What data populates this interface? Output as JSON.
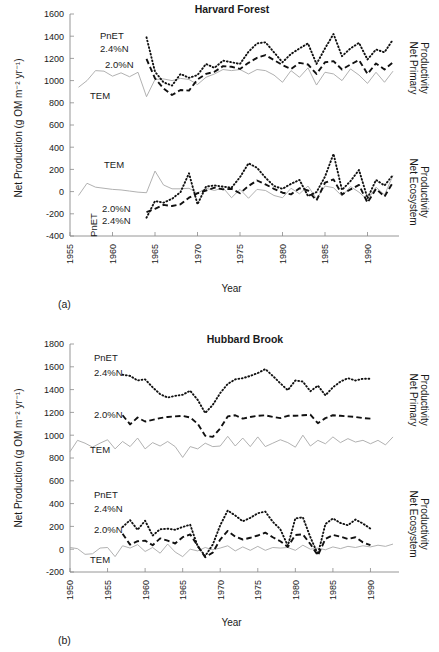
{
  "figure": {
    "y_axis_label": "Net Production (g OM m⁻² yr⁻¹)",
    "x_axis_label": "Year",
    "right_label_npp": "Net Primary Productivity",
    "right_label_nep": "Net Ecosystem Productivity",
    "panel_a_letter": "(a)",
    "panel_b_letter": "(b)",
    "series_label_pnet": "PnET",
    "series_label_n24": "2.4%N",
    "series_label_n20": "2.0%N",
    "series_label_tem": "TEM",
    "colors": {
      "tem": "#a8a8a8",
      "pnet": "#111111",
      "axis": "#8a8a8a",
      "text": "#1a1a1a",
      "background": "#ffffff"
    }
  },
  "chart_data": [
    {
      "type": "line",
      "title": "Harvard Forest",
      "panel": "(a)",
      "xlabel": "Year",
      "ylabel": "Net Production (g OM m⁻² yr⁻¹)",
      "right_labels": [
        "Net Primary Productivity",
        "Net Ecosystem Productivity"
      ],
      "xlim": [
        1955,
        1993
      ],
      "ylim": [
        -400,
        1600
      ],
      "yticks": [
        -400,
        -200,
        0,
        200,
        400,
        600,
        800,
        1000,
        1200,
        1400,
        1600
      ],
      "xticks": [
        1955,
        1960,
        1965,
        1970,
        1975,
        1980,
        1985,
        1990
      ],
      "grid": false,
      "legend": "in-plot annotations",
      "series": [
        {
          "name": "TEM",
          "group": "Net Primary Productivity",
          "style": "solid-gray",
          "x": [
            1956,
            1957,
            1958,
            1959,
            1960,
            1961,
            1962,
            1963,
            1964,
            1965,
            1966,
            1967,
            1968,
            1969,
            1970,
            1971,
            1972,
            1973,
            1974,
            1975,
            1976,
            1977,
            1978,
            1979,
            1980,
            1981,
            1982,
            1983,
            1984,
            1985,
            1986,
            1987,
            1988,
            1989,
            1990,
            1991,
            1992,
            1993
          ],
          "values": [
            940,
            1000,
            1090,
            1085,
            1040,
            1070,
            1035,
            1075,
            855,
            1010,
            1015,
            1000,
            1020,
            1010,
            965,
            1030,
            1060,
            1100,
            1090,
            1100,
            1060,
            1100,
            1090,
            1050,
            985,
            1090,
            1030,
            1115,
            960,
            1075,
            1060,
            1000,
            1105,
            1050,
            975,
            1075,
            985,
            1085
          ]
        },
        {
          "name": "PnET 2.0%N",
          "group": "Net Primary Productivity",
          "style": "dashed",
          "x": [
            1964,
            1965,
            1966,
            1967,
            1968,
            1969,
            1970,
            1971,
            1972,
            1973,
            1974,
            1975,
            1976,
            1977,
            1978,
            1979,
            1980,
            1981,
            1982,
            1983,
            1984,
            1985,
            1986,
            1987,
            1988,
            1989,
            1990,
            1991,
            1992,
            1993
          ],
          "values": [
            1195,
            1020,
            930,
            870,
            915,
            910,
            1010,
            1060,
            1080,
            1130,
            1125,
            1105,
            1160,
            1205,
            1230,
            1185,
            1140,
            1105,
            1160,
            1145,
            1060,
            1165,
            1175,
            1100,
            1145,
            1185,
            1060,
            1155,
            1100,
            1165
          ]
        },
        {
          "name": "PnET 2.4%N",
          "group": "Net Primary Productivity",
          "style": "dotted",
          "x": [
            1964,
            1965,
            1966,
            1967,
            1968,
            1969,
            1970,
            1971,
            1972,
            1973,
            1974,
            1975,
            1976,
            1977,
            1978,
            1979,
            1980,
            1981,
            1982,
            1983,
            1984,
            1985,
            1986,
            1987,
            1988,
            1989,
            1990,
            1991,
            1992,
            1993
          ],
          "values": [
            1390,
            1080,
            985,
            955,
            1060,
            1025,
            1050,
            1150,
            1115,
            1180,
            1165,
            1150,
            1260,
            1335,
            1345,
            1255,
            1165,
            1240,
            1290,
            1335,
            1150,
            1290,
            1420,
            1220,
            1290,
            1340,
            1190,
            1280,
            1255,
            1370
          ]
        },
        {
          "name": "TEM",
          "group": "Net Ecosystem Productivity",
          "style": "solid-gray",
          "x": [
            1956,
            1957,
            1958,
            1959,
            1960,
            1961,
            1962,
            1963,
            1964,
            1965,
            1966,
            1967,
            1968,
            1969,
            1970,
            1971,
            1972,
            1973,
            1974,
            1975,
            1976,
            1977,
            1978,
            1979,
            1980,
            1981,
            1982,
            1983,
            1984,
            1985,
            1986,
            1987,
            1988,
            1989,
            1990,
            1991,
            1992,
            1993
          ],
          "values": [
            -35,
            75,
            40,
            30,
            20,
            15,
            5,
            -5,
            -10,
            185,
            60,
            25,
            25,
            30,
            -15,
            30,
            10,
            35,
            -55,
            20,
            -60,
            20,
            10,
            -35,
            -55,
            30,
            -20,
            50,
            -65,
            50,
            35,
            -40,
            45,
            -5,
            -75,
            40,
            -30,
            145
          ]
        },
        {
          "name": "PnET 2.0%N",
          "group": "Net Ecosystem Productivity",
          "style": "dashed",
          "x": [
            1964,
            1965,
            1966,
            1967,
            1968,
            1969,
            1970,
            1971,
            1972,
            1973,
            1974,
            1975,
            1976,
            1977,
            1978,
            1979,
            1980,
            1981,
            1982,
            1983,
            1984,
            1985,
            1986,
            1987,
            1988,
            1989,
            1990,
            1991,
            1992,
            1993
          ],
          "values": [
            -185,
            -155,
            -120,
            -130,
            -115,
            -55,
            -15,
            10,
            35,
            20,
            25,
            -15,
            50,
            100,
            65,
            25,
            -10,
            -25,
            30,
            10,
            -80,
            80,
            110,
            -25,
            20,
            60,
            -100,
            25,
            -45,
            85
          ]
        },
        {
          "name": "PnET 2.4%N",
          "group": "Net Ecosystem Productivity",
          "style": "dotted",
          "x": [
            1964,
            1965,
            1966,
            1967,
            1968,
            1969,
            1970,
            1971,
            1972,
            1973,
            1974,
            1975,
            1976,
            1977,
            1978,
            1979,
            1980,
            1981,
            1982,
            1983,
            1984,
            1985,
            1986,
            1987,
            1988,
            1989,
            1990,
            1991,
            1992,
            1993
          ],
          "values": [
            -235,
            -85,
            -100,
            -65,
            -5,
            165,
            -115,
            45,
            55,
            45,
            35,
            130,
            255,
            215,
            125,
            50,
            25,
            70,
            105,
            -40,
            -5,
            135,
            340,
            15,
            95,
            195,
            -60,
            105,
            55,
            150
          ]
        }
      ]
    },
    {
      "type": "line",
      "title": "Hubbard Brook",
      "panel": "(b)",
      "xlabel": "Year",
      "ylabel": "Net Production (g OM m⁻² yr⁻¹)",
      "right_labels": [
        "Net Primary Productivity",
        "Net Ecosystem Productivity"
      ],
      "xlim": [
        1950,
        1993
      ],
      "ylim": [
        -200,
        1800
      ],
      "yticks": [
        -200,
        0,
        200,
        400,
        600,
        800,
        1000,
        1200,
        1400,
        1600,
        1800
      ],
      "xticks": [
        1950,
        1955,
        1960,
        1965,
        1970,
        1975,
        1980,
        1985,
        1990
      ],
      "grid": false,
      "legend": "in-plot annotations",
      "series": [
        {
          "name": "TEM",
          "group": "Net Primary Productivity",
          "style": "solid-gray",
          "x": [
            1950,
            1951,
            1952,
            1953,
            1954,
            1955,
            1956,
            1957,
            1958,
            1959,
            1960,
            1961,
            1962,
            1963,
            1964,
            1965,
            1966,
            1967,
            1968,
            1969,
            1970,
            1971,
            1972,
            1973,
            1974,
            1975,
            1976,
            1977,
            1978,
            1979,
            1980,
            1981,
            1982,
            1983,
            1984,
            1985,
            1986,
            1987,
            1988,
            1989,
            1990,
            1991,
            1992,
            1993
          ],
          "values": [
            855,
            955,
            930,
            895,
            930,
            960,
            880,
            945,
            900,
            975,
            880,
            935,
            905,
            945,
            900,
            805,
            900,
            880,
            930,
            900,
            905,
            990,
            905,
            975,
            900,
            985,
            900,
            930,
            960,
            935,
            895,
            1000,
            905,
            955,
            925,
            985,
            935,
            970,
            940,
            955,
            925,
            955,
            915,
            985
          ]
        },
        {
          "name": "PnET 2.0%N",
          "group": "Net Primary Productivity",
          "style": "dashed",
          "x": [
            1957,
            1958,
            1959,
            1960,
            1961,
            1962,
            1963,
            1964,
            1965,
            1966,
            1967,
            1968,
            1969,
            1970,
            1971,
            1972,
            1973,
            1974,
            1975,
            1976,
            1977,
            1978,
            1979,
            1980,
            1981,
            1982,
            1983,
            1984,
            1985,
            1986,
            1987,
            1988,
            1989,
            1990
          ],
          "values": [
            1175,
            1095,
            1155,
            1120,
            1135,
            1150,
            1160,
            1165,
            1170,
            1155,
            1100,
            995,
            985,
            1060,
            1165,
            1175,
            1145,
            1160,
            1170,
            1175,
            1160,
            1150,
            1170,
            1170,
            1175,
            1180,
            1105,
            1150,
            1175,
            1170,
            1165,
            1160,
            1150,
            1145
          ]
        },
        {
          "name": "PnET 2.4%N",
          "group": "Net Primary Productivity",
          "style": "dotted",
          "x": [
            1957,
            1958,
            1959,
            1960,
            1961,
            1962,
            1963,
            1964,
            1965,
            1966,
            1967,
            1968,
            1969,
            1970,
            1971,
            1972,
            1973,
            1974,
            1975,
            1976,
            1977,
            1978,
            1979,
            1980,
            1981,
            1982,
            1983,
            1984,
            1985,
            1986,
            1987,
            1988,
            1989,
            1990
          ],
          "values": [
            1530,
            1520,
            1480,
            1490,
            1420,
            1360,
            1330,
            1345,
            1355,
            1390,
            1310,
            1195,
            1265,
            1370,
            1450,
            1490,
            1500,
            1520,
            1545,
            1580,
            1520,
            1455,
            1395,
            1480,
            1470,
            1385,
            1435,
            1350,
            1420,
            1470,
            1500,
            1480,
            1495,
            1495
          ]
        },
        {
          "name": "TEM",
          "group": "Net Ecosystem Productivity",
          "style": "solid-gray",
          "x": [
            1950,
            1951,
            1952,
            1953,
            1954,
            1955,
            1956,
            1957,
            1958,
            1959,
            1960,
            1961,
            1962,
            1963,
            1964,
            1965,
            1966,
            1967,
            1968,
            1969,
            1970,
            1971,
            1972,
            1973,
            1974,
            1975,
            1976,
            1977,
            1978,
            1979,
            1980,
            1981,
            1982,
            1983,
            1984,
            1985,
            1986,
            1987,
            1988,
            1989,
            1990,
            1991,
            1992,
            1993
          ],
          "values": [
            15,
            5,
            -45,
            -40,
            10,
            15,
            -65,
            30,
            10,
            40,
            -20,
            15,
            -35,
            45,
            -25,
            -65,
            0,
            -15,
            15,
            -5,
            10,
            30,
            -15,
            20,
            -10,
            25,
            -10,
            15,
            10,
            15,
            -10,
            35,
            0,
            10,
            -5,
            20,
            5,
            25,
            15,
            30,
            20,
            35,
            25,
            45
          ]
        },
        {
          "name": "PnET 2.0%N",
          "group": "Net Ecosystem Productivity",
          "style": "dashed",
          "x": [
            1957,
            1958,
            1959,
            1960,
            1961,
            1962,
            1963,
            1964,
            1965,
            1966,
            1967,
            1968,
            1969,
            1970,
            1971,
            1972,
            1973,
            1974,
            1975,
            1976,
            1977,
            1978,
            1979,
            1980,
            1981,
            1982,
            1983,
            1984,
            1985,
            1986,
            1987,
            1988,
            1989,
            1990
          ],
          "values": [
            135,
            40,
            70,
            75,
            35,
            95,
            75,
            50,
            105,
            130,
            30,
            -70,
            -30,
            85,
            160,
            110,
            85,
            100,
            120,
            145,
            105,
            70,
            20,
            125,
            130,
            45,
            -55,
            90,
            125,
            110,
            90,
            105,
            60,
            35
          ]
        },
        {
          "name": "PnET 2.4%N",
          "group": "Net Ecosystem Productivity",
          "style": "dotted",
          "x": [
            1957,
            1958,
            1959,
            1960,
            1961,
            1962,
            1963,
            1964,
            1965,
            1966,
            1967,
            1968,
            1969,
            1970,
            1971,
            1972,
            1973,
            1974,
            1975,
            1976,
            1977,
            1978,
            1979,
            1980,
            1981,
            1982,
            1983,
            1984,
            1985,
            1986,
            1987,
            1988,
            1989,
            1990
          ],
          "values": [
            195,
            255,
            170,
            250,
            120,
            175,
            180,
            170,
            195,
            215,
            25,
            -60,
            40,
            210,
            340,
            295,
            245,
            275,
            315,
            330,
            240,
            175,
            30,
            270,
            280,
            105,
            -45,
            220,
            270,
            230,
            210,
            260,
            225,
            180
          ]
        }
      ]
    }
  ]
}
